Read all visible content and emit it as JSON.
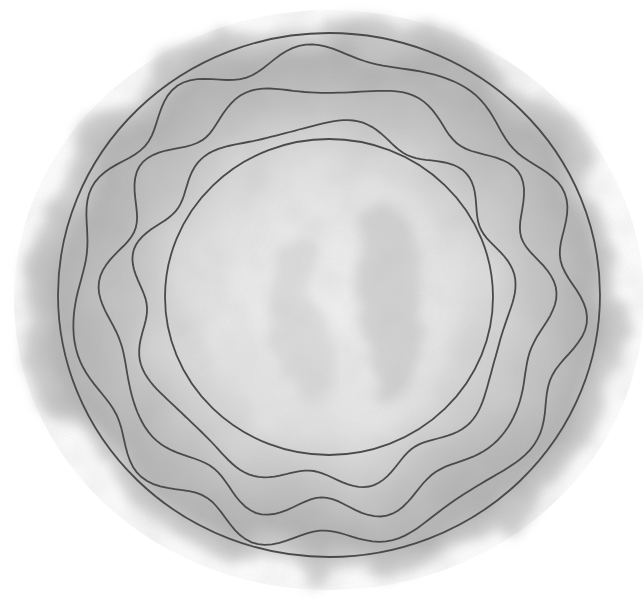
{
  "artwork": {
    "subject": "concentric circles and wavy rings over gray watercolor wash",
    "colors": {
      "background": "#ffffff",
      "wash_dark": "#a9a9a9",
      "wash_mid": "#c4c4c4",
      "wash_light": "#e6e6e6",
      "center_light": "#f2f2f2",
      "line": "#4a4a4a"
    },
    "center": [
      329,
      295
    ],
    "outer_circle": {
      "rx": 271,
      "ry": 262
    },
    "inner_circle": {
      "rx": 164,
      "ry": 158
    },
    "wavy_rings": [
      {
        "base_rx": 250,
        "base_ry": 244,
        "amp": 9,
        "waves": 11,
        "phase": 0.3,
        "dx": -3,
        "dy": 2
      },
      {
        "base_rx": 218,
        "base_ry": 212,
        "amp": 10,
        "waves": 10,
        "phase": 1.4,
        "dx": -2,
        "dy": 4
      },
      {
        "base_rx": 186,
        "base_ry": 178,
        "amp": 8,
        "waves": 9,
        "phase": 2.2,
        "dx": -6,
        "dy": 8
      }
    ]
  }
}
